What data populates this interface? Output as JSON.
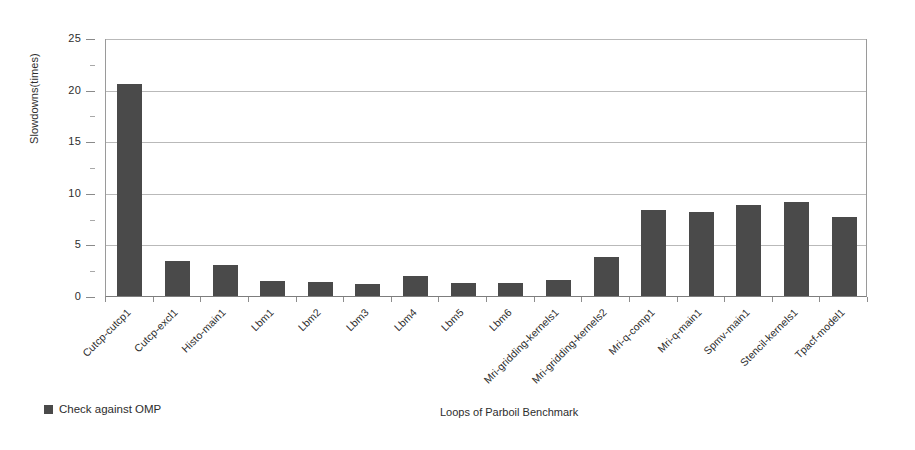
{
  "chart_data": {
    "type": "bar",
    "title": "",
    "subtitle": "",
    "xlabel": "Loops of Parboil Benchmark",
    "ylabel": "Slowdowns(times)",
    "ylim": [
      0,
      25
    ],
    "ytick_values": [
      0,
      5,
      10,
      15,
      20,
      25
    ],
    "ytick_labels": [
      "0",
      "5",
      "10",
      "15",
      "20",
      "25"
    ],
    "grid": "horizontal",
    "legend_position": "bottom-left",
    "series": [
      {
        "name": "Check against OMP",
        "color": "#4a4a4a",
        "values": [
          20.5,
          3.4,
          3.0,
          1.45,
          1.35,
          1.15,
          1.9,
          1.25,
          1.25,
          1.55,
          3.8,
          8.3,
          8.15,
          8.8,
          9.1,
          7.7
        ]
      }
    ],
    "categories": [
      "Cutcp-cutcp1",
      "Cutcp-excl1",
      "Histo-main1",
      "Lbm1",
      "Lbm2",
      "Lbm3",
      "Lbm4",
      "Lbm5",
      "Lbm6",
      "Mri-gridding-kernels1",
      "Mri-gridding-kernels2",
      "Mri-q-comp1",
      "Mri-q-main1",
      "Spmv-main1",
      "Stencil-kernels1",
      "Tpacf-model1"
    ]
  },
  "legend": {
    "entries": [
      {
        "label": "Check against OMP",
        "color": "#4a4a4a",
        "marker": "square-marker"
      }
    ]
  },
  "axes": {
    "y_title": "Slowdowns(times)",
    "x_title": "Loops of Parboil Benchmark"
  },
  "colors": {
    "bar": "#4a4a4a",
    "gridline": "#b9b9b9",
    "axis": "#8a8a8a",
    "text": "#2d2d2d",
    "background": "#ffffff"
  }
}
